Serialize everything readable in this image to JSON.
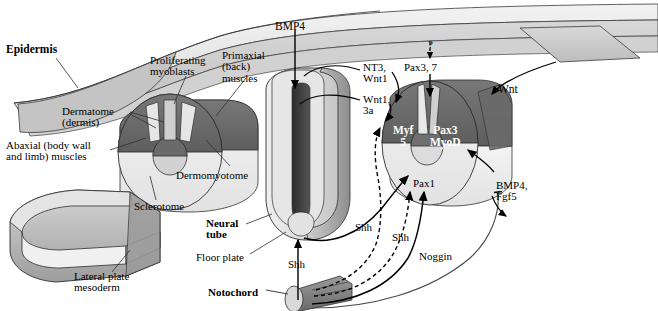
{
  "figure": {
    "type": "embryology-diagram"
  },
  "anatomy_labels": [
    {
      "id": "epidermis",
      "text": "Epidermis",
      "bold": true,
      "x": 6,
      "y": 44,
      "size": 11.5,
      "align": "left"
    },
    {
      "id": "proliferating",
      "text": "Proliferating\nmyoblasts",
      "bold": false,
      "x": 150,
      "y": 55,
      "size": 11,
      "align": "left"
    },
    {
      "id": "primaxial",
      "text": "Primaxial\n(back)\nmuscles",
      "bold": false,
      "x": 222,
      "y": 50,
      "size": 11,
      "align": "left"
    },
    {
      "id": "dermatome",
      "text": "Dermatome\n(dermis)",
      "bold": false,
      "x": 62,
      "y": 106,
      "size": 11,
      "align": "left"
    },
    {
      "id": "abaxial",
      "text": "Abaxial (body wall\nand limb) muscles",
      "bold": false,
      "x": 6,
      "y": 140,
      "size": 11,
      "align": "left"
    },
    {
      "id": "sclerotome",
      "text": "Sclerotome",
      "bold": false,
      "x": 134,
      "y": 201,
      "size": 11,
      "align": "left"
    },
    {
      "id": "dermomyotome",
      "text": "Dermomyotome",
      "bold": false,
      "x": 176,
      "y": 170,
      "size": 11,
      "align": "left"
    },
    {
      "id": "neural-tube",
      "text": "Neural\ntube",
      "bold": true,
      "x": 206,
      "y": 218,
      "size": 11,
      "align": "left"
    },
    {
      "id": "floor-plate",
      "text": "Floor plate",
      "bold": false,
      "x": 196,
      "y": 252,
      "size": 11,
      "align": "left"
    },
    {
      "id": "notochord",
      "text": "Notochord",
      "bold": true,
      "x": 208,
      "y": 287,
      "size": 11,
      "align": "left"
    },
    {
      "id": "lateral-plate",
      "text": "Lateral plate\nmesoderm",
      "bold": false,
      "x": 74,
      "y": 271,
      "size": 11,
      "align": "left"
    }
  ],
  "signal_labels": [
    {
      "id": "bmp4-top",
      "text": "BMP4",
      "x": 275,
      "y": 21,
      "size": 11.5
    },
    {
      "id": "question",
      "text": "?",
      "x": 428,
      "y": 39,
      "size": 11
    },
    {
      "id": "nt3-wnt1",
      "text": "NT3,\nWnt1",
      "x": 363,
      "y": 62,
      "size": 11
    },
    {
      "id": "pax3-7",
      "text": "Pax3, 7",
      "x": 404,
      "y": 62,
      "size": 11
    },
    {
      "id": "wnt1-3a",
      "text": "Wnt1,\n3a",
      "x": 363,
      "y": 94,
      "size": 11
    },
    {
      "id": "wnt-right",
      "text": "Wnt",
      "x": 498,
      "y": 84,
      "size": 11.5
    },
    {
      "id": "pax1",
      "text": "Pax1",
      "x": 413,
      "y": 178,
      "size": 11
    },
    {
      "id": "shh-nt",
      "text": "Shh",
      "x": 355,
      "y": 222,
      "size": 11
    },
    {
      "id": "shh-mid",
      "text": "Shh",
      "x": 392,
      "y": 232,
      "size": 11
    },
    {
      "id": "shh-noto",
      "text": "Shh",
      "x": 288,
      "y": 259,
      "size": 11
    },
    {
      "id": "noggin",
      "text": "Noggin",
      "x": 419,
      "y": 251,
      "size": 11
    },
    {
      "id": "bmp4-fgf5",
      "text": "BMP4,\nFgf5",
      "x": 496,
      "y": 180,
      "size": 11
    }
  ],
  "gene_labels": [
    {
      "id": "myf5",
      "text": "Myf\n5",
      "x": 393,
      "y": 125,
      "size": 11.5
    },
    {
      "id": "pax3-myod",
      "text": "Pax3\nMyoD",
      "x": 430,
      "y": 125,
      "size": 11.5
    }
  ],
  "colors": {
    "background": "#ffffff",
    "ink": "#000000",
    "epidermis_top": "#e9e9e9",
    "epidermis_side": "#d2d2d2",
    "dermomyotome_dark": "#6e6e6e",
    "sclerotome_light": "#f0f0f0",
    "neural_tube": "#d9d9d9",
    "neural_lumen": "#4a4a4a",
    "notochord": "#8d8d8d",
    "lateral_plate": "#a9a9a9"
  }
}
